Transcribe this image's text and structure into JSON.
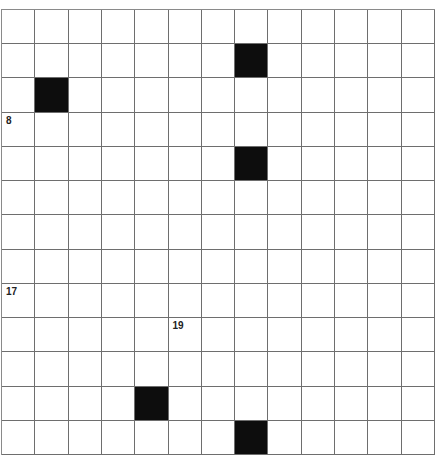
{
  "puzzle": {
    "rows": 13,
    "cols": 13,
    "colors": {
      "block": "#0d0d0d",
      "cell": "#ffffff",
      "line": "#6e6e6e",
      "number": "#222222"
    },
    "black_cells": [
      [
        1,
        7
      ],
      [
        2,
        1
      ],
      [
        4,
        7
      ],
      [
        11,
        4
      ],
      [
        12,
        7
      ]
    ],
    "numbers": [
      {
        "row": 3,
        "col": 0,
        "label": "8"
      },
      {
        "row": 8,
        "col": 0,
        "label": "17"
      },
      {
        "row": 9,
        "col": 5,
        "label": "19"
      }
    ]
  }
}
